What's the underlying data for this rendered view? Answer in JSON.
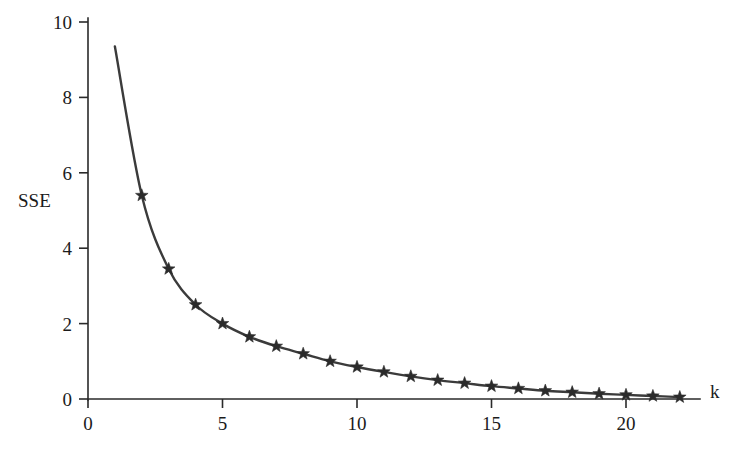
{
  "figure": {
    "name": "sse-elbow-plot",
    "background_color": "#ffffff",
    "line_color": "#3b3b3b",
    "marker_color": "#2b2b2b",
    "axis_color": "#2a2a2a"
  },
  "chart_data": {
    "type": "line",
    "title": "",
    "subtitle": "",
    "xlabel": "k",
    "ylabel": "SSE",
    "xlim": [
      0,
      23
    ],
    "ylim": [
      0,
      10
    ],
    "grid": false,
    "legend": null,
    "marker": "star",
    "x_ticks": [
      0,
      5,
      10,
      15,
      20
    ],
    "x_tick_labels": [
      "0",
      "5",
      "10",
      "15",
      "20"
    ],
    "y_ticks": [
      0,
      2,
      4,
      6,
      8,
      10
    ],
    "y_tick_labels": [
      "0",
      "2",
      "4",
      "6",
      "8",
      "10"
    ],
    "curve_start": {
      "x": 1.0,
      "y": 9.35
    },
    "x": [
      1,
      2,
      3,
      4,
      5,
      6,
      7,
      8,
      9,
      10,
      11,
      12,
      13,
      14,
      15,
      16,
      17,
      18,
      19,
      20,
      21,
      22
    ],
    "values": [
      9.35,
      5.4,
      3.45,
      2.5,
      2.0,
      1.65,
      1.4,
      1.2,
      1.0,
      0.85,
      0.72,
      0.6,
      0.5,
      0.42,
      0.34,
      0.28,
      0.22,
      0.18,
      0.14,
      0.11,
      0.08,
      0.05
    ],
    "marker_x": [
      2,
      3,
      4,
      5,
      6,
      7,
      8,
      9,
      10,
      11,
      12,
      13,
      14,
      15,
      16,
      17,
      18,
      19,
      20,
      21,
      22
    ],
    "marker_values": [
      5.4,
      3.45,
      2.5,
      2.0,
      1.65,
      1.4,
      1.2,
      1.0,
      0.85,
      0.72,
      0.6,
      0.5,
      0.42,
      0.34,
      0.28,
      0.22,
      0.18,
      0.14,
      0.11,
      0.08,
      0.05
    ],
    "series": [
      {
        "name": "SSE",
        "x": [
          1,
          2,
          3,
          4,
          5,
          6,
          7,
          8,
          9,
          10,
          11,
          12,
          13,
          14,
          15,
          16,
          17,
          18,
          19,
          20,
          21,
          22
        ],
        "values": [
          9.35,
          5.4,
          3.45,
          2.5,
          2.0,
          1.65,
          1.4,
          1.2,
          1.0,
          0.85,
          0.72,
          0.6,
          0.5,
          0.42,
          0.34,
          0.28,
          0.22,
          0.18,
          0.14,
          0.11,
          0.08,
          0.05
        ]
      }
    ]
  },
  "caption": {
    "text": ""
  }
}
